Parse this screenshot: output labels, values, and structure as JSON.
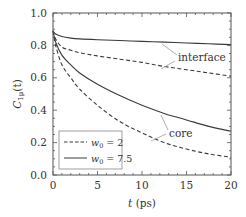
{
  "chart_data": {
    "type": "line",
    "title": "",
    "xlabel": "t (ps)",
    "ylabel": "C1μ(t)",
    "xlim": [
      0,
      20
    ],
    "ylim": [
      0.0,
      1.0
    ],
    "xticks": [
      "0",
      "5",
      "10",
      "15",
      "20"
    ],
    "yticks": [
      "0.0",
      "0.2",
      "0.4",
      "0.6",
      "0.8",
      "1.0"
    ],
    "grid": false,
    "legend_position": "lower left",
    "legend": [
      {
        "label": "w0 = 2",
        "style": "dashed"
      },
      {
        "label": "w0 = 7.5",
        "style": "solid"
      }
    ],
    "annotations": [
      "interface",
      "core"
    ],
    "x": [
      0,
      0.3,
      1,
      2,
      3,
      5,
      7.5,
      10,
      12.5,
      15,
      17.5,
      20
    ],
    "series": [
      {
        "name": "interface, w0 = 7.5",
        "style": "solid",
        "values": [
          0.89,
          0.87,
          0.855,
          0.845,
          0.84,
          0.835,
          0.83,
          0.825,
          0.82,
          0.815,
          0.81,
          0.805
        ]
      },
      {
        "name": "interface, w0 = 2",
        "style": "dashed",
        "values": [
          0.89,
          0.84,
          0.79,
          0.77,
          0.755,
          0.735,
          0.715,
          0.695,
          0.67,
          0.65,
          0.63,
          0.61
        ]
      },
      {
        "name": "core, w0 = 7.5",
        "style": "solid",
        "values": [
          0.89,
          0.82,
          0.74,
          0.68,
          0.63,
          0.56,
          0.49,
          0.43,
          0.38,
          0.34,
          0.3,
          0.27
        ]
      },
      {
        "name": "core, w0 = 2",
        "style": "dashed",
        "values": [
          0.89,
          0.8,
          0.68,
          0.6,
          0.53,
          0.43,
          0.33,
          0.26,
          0.2,
          0.16,
          0.13,
          0.11
        ]
      }
    ]
  },
  "axes": {
    "xlabel_var": "t",
    "xlabel_unit": " (ps)",
    "ylabel_main": "C",
    "ylabel_sub": "1μ",
    "ylabel_arg": "(t)"
  },
  "legend": {
    "item1_var": "w",
    "item1_sub": "0",
    "item1_val": " = 2",
    "item2_var": "w",
    "item2_sub": "0",
    "item2_val": " = 7.5"
  },
  "annotations": {
    "interface": "interface",
    "core": "core"
  },
  "colors": {
    "line": "#3a3a3a",
    "frame": "#555555",
    "annotation_leader": "#999999"
  }
}
